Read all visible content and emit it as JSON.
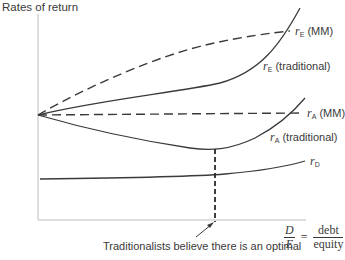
{
  "diagram": {
    "y_axis_label": "Rates of return",
    "x_axis_label": {
      "left_numerator": "D",
      "left_denominator": "E",
      "equals": "=",
      "right_numerator": "debt",
      "right_denominator": "equity"
    },
    "annotation": "Traditionalists believe there is an optimal",
    "curves": [
      {
        "id": "rE_MM",
        "symbol": "r",
        "subscript": "E",
        "suffix": "(MM)",
        "style": "dashed"
      },
      {
        "id": "rE_traditional",
        "symbol": "r",
        "subscript": "E",
        "suffix": "(traditional)",
        "style": "solid"
      },
      {
        "id": "rA_MM",
        "symbol": "r",
        "subscript": "A",
        "suffix": "(MM)",
        "style": "dashed"
      },
      {
        "id": "rA_traditional",
        "symbol": "r",
        "subscript": "A",
        "suffix": "(traditional)",
        "style": "solid"
      },
      {
        "id": "rD",
        "symbol": "r",
        "subscript": "D",
        "suffix": "",
        "style": "solid"
      }
    ],
    "colors": {
      "line": "#3a3a3a",
      "axis": "#bdbdbd"
    }
  }
}
